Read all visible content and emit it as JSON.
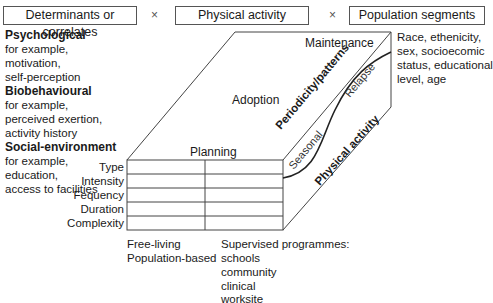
{
  "headers": {
    "determinants": "Determinants or correlates",
    "physical_activity": "Physical activity",
    "population": "Population segments",
    "times1": "×",
    "times2": "×"
  },
  "determinants": [
    {
      "title": "Psychological",
      "lines": [
        "for example,",
        "motivation,",
        "self-perception"
      ]
    },
    {
      "title": "Biobehavioural",
      "lines": [
        "for example,",
        "perceived exertion,",
        "activity history"
      ]
    },
    {
      "title": "Social-environment",
      "lines": [
        "for example,",
        "education,",
        "access to facilities"
      ]
    }
  ],
  "population_text": [
    "Race, ethenicity,",
    "sex, socioecomic",
    "status, educational",
    "level, age"
  ],
  "stages": {
    "maintenance": "Maintenance",
    "adoption": "Adoption",
    "planning": "Planning"
  },
  "rows": [
    "Type",
    "Intensity",
    "Fequency",
    "Duration",
    "Complexity"
  ],
  "side": {
    "periodicity": "Periodicity/patterns",
    "seasonal": "Seasonal",
    "relapse": "Relapse",
    "physical_activity": "Physical activity"
  },
  "settings": {
    "free_living": [
      "Free-living",
      "Population-based"
    ],
    "supervised": [
      "Supervised programmes:",
      "schools",
      "community",
      "clinical",
      "worksite"
    ]
  }
}
